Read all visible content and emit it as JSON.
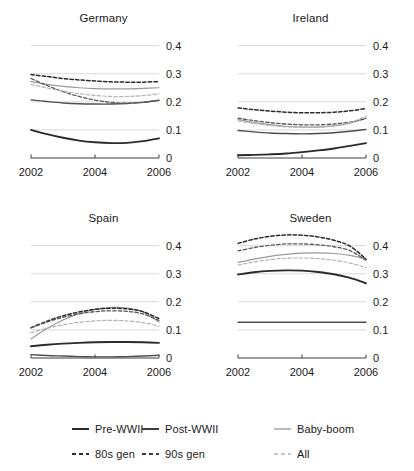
{
  "figure": {
    "width": 414,
    "height": 471,
    "background": "#ffffff"
  },
  "chart_data": {
    "type": "line",
    "title": "",
    "xlabel": "",
    "ylabel": "",
    "grid": true,
    "grid_color": "#cfcfcf",
    "legend_position": "bottom",
    "xlim": [
      2002,
      2006
    ],
    "ylim": [
      0,
      0.42
    ],
    "xticks": [
      2002,
      2004,
      2006
    ],
    "xticklabels": [
      "2002",
      "2004",
      "2006"
    ],
    "yticks": [
      0,
      0.1,
      0.2,
      0.3,
      0.4
    ],
    "yticklabels": [
      "0",
      "0.1",
      "0.2",
      "0.3",
      "0.4"
    ],
    "ytick_side": "right",
    "x": [
      2002,
      2002.5,
      2003,
      2003.5,
      2004,
      2004.5,
      2005,
      2005.5,
      2006
    ],
    "series_styles": [
      {
        "name": "Pre-WWII",
        "color": "#2b2b2b",
        "dash": "solid",
        "width": 1.9
      },
      {
        "name": "Post-WWII",
        "color": "#4f4f4f",
        "dash": "solid",
        "width": 1.4
      },
      {
        "name": "Baby-boom",
        "color": "#9a9a9a",
        "dash": "solid",
        "width": 1.2
      },
      {
        "name": "80s gen",
        "color": "#2b2b2b",
        "dash": "dashed",
        "width": 1.5
      },
      {
        "name": "90s gen",
        "color": "#5a5a5a",
        "dash": "dashed",
        "width": 1.3
      },
      {
        "name": "All",
        "color": "#b4b4b4",
        "dash": "dashed",
        "width": 1.2
      }
    ],
    "panels": [
      {
        "title": "Germany",
        "series": [
          {
            "name": "Pre-WWII",
            "values": [
              0.1,
              0.085,
              0.072,
              0.062,
              0.056,
              0.053,
              0.054,
              0.06,
              0.07
            ]
          },
          {
            "name": "Post-WWII",
            "values": [
              0.207,
              0.201,
              0.196,
              0.193,
              0.192,
              0.192,
              0.194,
              0.198,
              0.205
            ]
          },
          {
            "name": "Baby-boom",
            "values": [
              0.272,
              0.262,
              0.255,
              0.25,
              0.247,
              0.246,
              0.246,
              0.248,
              0.25
            ]
          },
          {
            "name": "80s gen",
            "values": [
              0.297,
              0.29,
              0.283,
              0.278,
              0.274,
              0.271,
              0.27,
              0.27,
              0.272
            ]
          },
          {
            "name": "90s gen",
            "values": [
              0.283,
              0.258,
              0.236,
              0.219,
              0.206,
              0.198,
              0.195,
              0.198,
              0.206
            ]
          },
          {
            "name": "All",
            "values": [
              0.262,
              0.249,
              0.238,
              0.229,
              0.223,
              0.219,
              0.219,
              0.222,
              0.228
            ]
          }
        ]
      },
      {
        "title": "Ireland",
        "series": [
          {
            "name": "Pre-WWII",
            "values": [
              0.01,
              0.011,
              0.013,
              0.016,
              0.021,
              0.027,
              0.034,
              0.043,
              0.053
            ]
          },
          {
            "name": "Post-WWII",
            "values": [
              0.098,
              0.093,
              0.089,
              0.087,
              0.086,
              0.087,
              0.09,
              0.095,
              0.102
            ]
          },
          {
            "name": "Baby-boom",
            "values": [
              0.137,
              0.127,
              0.119,
              0.113,
              0.11,
              0.11,
              0.114,
              0.124,
              0.143
            ]
          },
          {
            "name": "80s gen",
            "values": [
              0.178,
              0.172,
              0.167,
              0.163,
              0.161,
              0.161,
              0.163,
              0.168,
              0.176
            ]
          },
          {
            "name": "90s gen",
            "values": [
              0.142,
              0.133,
              0.126,
              0.121,
              0.118,
              0.118,
              0.121,
              0.128,
              0.14
            ]
          },
          {
            "name": "All",
            "values": [
              0.132,
              0.123,
              0.116,
              0.111,
              0.109,
              0.11,
              0.115,
              0.126,
              0.148
            ]
          }
        ]
      },
      {
        "title": "Spain",
        "series": [
          {
            "name": "Pre-WWII",
            "values": [
              0.042,
              0.047,
              0.051,
              0.054,
              0.056,
              0.057,
              0.057,
              0.056,
              0.054
            ]
          },
          {
            "name": "Post-WWII",
            "values": [
              0.012,
              0.009,
              0.007,
              0.005,
              0.004,
              0.004,
              0.005,
              0.007,
              0.01
            ]
          },
          {
            "name": "Baby-boom",
            "values": [
              0.068,
              0.105,
              0.135,
              0.158,
              0.173,
              0.18,
              0.178,
              0.164,
              0.128
            ]
          },
          {
            "name": "80s gen",
            "values": [
              0.108,
              0.131,
              0.15,
              0.164,
              0.173,
              0.177,
              0.175,
              0.165,
              0.14
            ]
          },
          {
            "name": "90s gen",
            "values": [
              0.107,
              0.128,
              0.145,
              0.157,
              0.165,
              0.168,
              0.166,
              0.157,
              0.134
            ]
          },
          {
            "name": "All",
            "values": [
              0.09,
              0.106,
              0.118,
              0.127,
              0.132,
              0.134,
              0.132,
              0.126,
              0.113
            ]
          }
        ]
      },
      {
        "title": "Sweden",
        "series": [
          {
            "name": "Pre-WWII",
            "values": [
              0.297,
              0.305,
              0.31,
              0.312,
              0.311,
              0.306,
              0.298,
              0.285,
              0.266
            ]
          },
          {
            "name": "Post-WWII",
            "values": [
              0.127,
              0.127,
              0.127,
              0.127,
              0.127,
              0.127,
              0.127,
              0.127,
              0.127
            ]
          },
          {
            "name": "Baby-boom",
            "values": [
              0.34,
              0.352,
              0.362,
              0.369,
              0.373,
              0.374,
              0.372,
              0.365,
              0.352
            ]
          },
          {
            "name": "80s gen",
            "values": [
              0.408,
              0.423,
              0.433,
              0.438,
              0.437,
              0.431,
              0.419,
              0.398,
              0.352
            ]
          },
          {
            "name": "90s gen",
            "values": [
              0.381,
              0.393,
              0.401,
              0.406,
              0.406,
              0.403,
              0.396,
              0.382,
              0.348
            ]
          },
          {
            "name": "All",
            "values": [
              0.331,
              0.342,
              0.35,
              0.355,
              0.356,
              0.354,
              0.348,
              0.338,
              0.322
            ]
          }
        ]
      }
    ]
  },
  "legend": {
    "entries": [
      {
        "label": "Pre-WWII",
        "color": "#2b2b2b",
        "dash": "solid",
        "width": 2.0
      },
      {
        "label": "Post-WWII",
        "color": "#3d3d3d",
        "dash": "solid",
        "width": 2.0
      },
      {
        "label": "Baby-boom",
        "color": "#a8a8a8",
        "dash": "solid",
        "width": 1.6
      },
      {
        "label": "80s gen",
        "color": "#2b2b2b",
        "dash": "dashed",
        "width": 2.0
      },
      {
        "label": "90s gen",
        "color": "#3d3d3d",
        "dash": "dashed",
        "width": 2.0
      },
      {
        "label": "All",
        "color": "#b4b4b4",
        "dash": "dashed",
        "width": 1.6
      }
    ]
  }
}
